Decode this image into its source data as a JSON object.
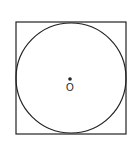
{
  "diagram": {
    "title": "",
    "shapes": {
      "square": {
        "x": 16,
        "y": 22,
        "width": 110,
        "height": 112,
        "stroke": "#222222"
      },
      "circle": {
        "cx": 71,
        "cy": 78,
        "r": 55,
        "stroke": "#222222"
      },
      "center_point": {
        "cx": 70,
        "cy": 79,
        "r": 1.8,
        "fill": "#222222"
      }
    },
    "labels": {
      "center": "O"
    }
  }
}
